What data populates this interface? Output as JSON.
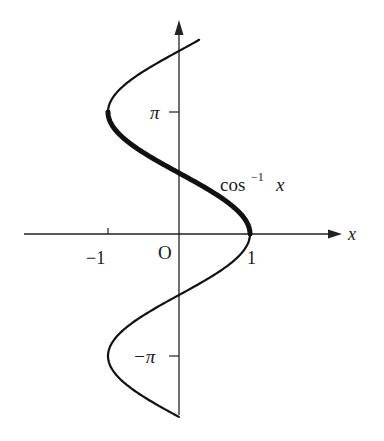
{
  "chart_data": {
    "type": "line",
    "title": "",
    "xlabel": "x",
    "ylabel": "",
    "curve_label": "cos⁻¹ x",
    "curve_label_base": "cos",
    "curve_label_sup": "−1",
    "curve_label_var": "x",
    "origin_label": "O",
    "x_ticks": [
      {
        "value": -1,
        "label": "−1"
      },
      {
        "value": 1,
        "label": "1"
      }
    ],
    "y_ticks": [
      {
        "value": 3.14159,
        "label": "π"
      },
      {
        "value": -3.14159,
        "label": "−π"
      }
    ],
    "series": [
      {
        "name": "x = cos y (full relation)",
        "y_range": [
          -4.71,
          5.0
        ],
        "style": "thin"
      },
      {
        "name": "cos⁻¹ x (principal branch)",
        "y_range": [
          0,
          3.14159
        ],
        "style": "thick"
      }
    ],
    "grid": false,
    "legend": "none",
    "xlim": [
      -2.1,
      2.6
    ],
    "ylim": [
      -4.8,
      5.5
    ]
  }
}
